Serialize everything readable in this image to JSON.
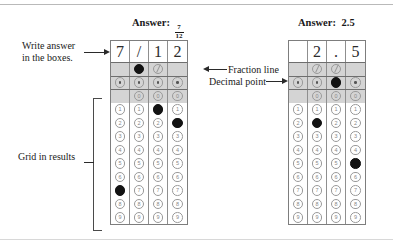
{
  "figure": {
    "title_hidden": "",
    "annotations": {
      "write_answer": "Write answer\nin the boxes.",
      "write_answer_line1": "Write answer",
      "write_answer_line2": "in the boxes.",
      "grid_in_results": "Grid in results",
      "fraction_line": "Fraction line",
      "decimal_point": "Decimal point"
    },
    "colors": {
      "fill": "#131313",
      "bubble_outline": "#9a9a9a",
      "band": "#d4d4d4",
      "grid_border": "#7d7d7d",
      "text": "#1a1a1a"
    }
  },
  "grids": [
    {
      "id": "left",
      "heading_label": "Answer:",
      "heading_value_type": "fraction",
      "heading_numerator": "7",
      "heading_denominator": "12",
      "heading_value": "7/12",
      "columns": [
        {
          "written": "7",
          "fraction_bubble": {
            "present": false,
            "filled": false,
            "glyph": "/"
          },
          "decimal_bubble": {
            "present": true,
            "filled": false,
            "glyph": "."
          },
          "digits": [
            {
              "label": "0",
              "present": false,
              "filled": false
            },
            {
              "label": "1",
              "present": true,
              "filled": false
            },
            {
              "label": "2",
              "present": true,
              "filled": false
            },
            {
              "label": "3",
              "present": true,
              "filled": false
            },
            {
              "label": "4",
              "present": true,
              "filled": false
            },
            {
              "label": "5",
              "present": true,
              "filled": false
            },
            {
              "label": "6",
              "present": true,
              "filled": false
            },
            {
              "label": "7",
              "present": true,
              "filled": true
            },
            {
              "label": "8",
              "present": true,
              "filled": false
            },
            {
              "label": "9",
              "present": true,
              "filled": false
            }
          ]
        },
        {
          "written": "/",
          "fraction_bubble": {
            "present": true,
            "filled": true,
            "glyph": "/"
          },
          "decimal_bubble": {
            "present": true,
            "filled": false,
            "glyph": "."
          },
          "digits": [
            {
              "label": "0",
              "present": true,
              "filled": false
            },
            {
              "label": "1",
              "present": true,
              "filled": false
            },
            {
              "label": "2",
              "present": true,
              "filled": false
            },
            {
              "label": "3",
              "present": true,
              "filled": false
            },
            {
              "label": "4",
              "present": true,
              "filled": false
            },
            {
              "label": "5",
              "present": true,
              "filled": false
            },
            {
              "label": "6",
              "present": true,
              "filled": false
            },
            {
              "label": "7",
              "present": true,
              "filled": false
            },
            {
              "label": "8",
              "present": true,
              "filled": false
            },
            {
              "label": "9",
              "present": true,
              "filled": false
            }
          ]
        },
        {
          "written": "1",
          "fraction_bubble": {
            "present": true,
            "filled": false,
            "glyph": "/"
          },
          "decimal_bubble": {
            "present": true,
            "filled": false,
            "glyph": "."
          },
          "digits": [
            {
              "label": "0",
              "present": true,
              "filled": false
            },
            {
              "label": "1",
              "present": true,
              "filled": true
            },
            {
              "label": "2",
              "present": true,
              "filled": false
            },
            {
              "label": "3",
              "present": true,
              "filled": false
            },
            {
              "label": "4",
              "present": true,
              "filled": false
            },
            {
              "label": "5",
              "present": true,
              "filled": false
            },
            {
              "label": "6",
              "present": true,
              "filled": false
            },
            {
              "label": "7",
              "present": true,
              "filled": false
            },
            {
              "label": "8",
              "present": true,
              "filled": false
            },
            {
              "label": "9",
              "present": true,
              "filled": false
            }
          ]
        },
        {
          "written": "2",
          "fraction_bubble": {
            "present": false,
            "filled": false,
            "glyph": "/"
          },
          "decimal_bubble": {
            "present": true,
            "filled": false,
            "glyph": "."
          },
          "digits": [
            {
              "label": "0",
              "present": true,
              "filled": false
            },
            {
              "label": "1",
              "present": true,
              "filled": false
            },
            {
              "label": "2",
              "present": true,
              "filled": true
            },
            {
              "label": "3",
              "present": true,
              "filled": false
            },
            {
              "label": "4",
              "present": true,
              "filled": false
            },
            {
              "label": "5",
              "present": true,
              "filled": false
            },
            {
              "label": "6",
              "present": true,
              "filled": false
            },
            {
              "label": "7",
              "present": true,
              "filled": false
            },
            {
              "label": "8",
              "present": true,
              "filled": false
            },
            {
              "label": "9",
              "present": true,
              "filled": false
            }
          ]
        }
      ]
    },
    {
      "id": "right",
      "heading_label": "Answer:",
      "heading_value_type": "decimal",
      "heading_value": "2.5",
      "columns": [
        {
          "written": "",
          "fraction_bubble": {
            "present": false,
            "filled": false,
            "glyph": "/"
          },
          "decimal_bubble": {
            "present": true,
            "filled": false,
            "glyph": "."
          },
          "digits": [
            {
              "label": "0",
              "present": false,
              "filled": false
            },
            {
              "label": "1",
              "present": true,
              "filled": false
            },
            {
              "label": "2",
              "present": true,
              "filled": false
            },
            {
              "label": "3",
              "present": true,
              "filled": false
            },
            {
              "label": "4",
              "present": true,
              "filled": false
            },
            {
              "label": "5",
              "present": true,
              "filled": false
            },
            {
              "label": "6",
              "present": true,
              "filled": false
            },
            {
              "label": "7",
              "present": true,
              "filled": false
            },
            {
              "label": "8",
              "present": true,
              "filled": false
            },
            {
              "label": "9",
              "present": true,
              "filled": false
            }
          ]
        },
        {
          "written": "2",
          "fraction_bubble": {
            "present": true,
            "filled": false,
            "glyph": "/"
          },
          "decimal_bubble": {
            "present": true,
            "filled": false,
            "glyph": "."
          },
          "digits": [
            {
              "label": "0",
              "present": true,
              "filled": false
            },
            {
              "label": "1",
              "present": true,
              "filled": false
            },
            {
              "label": "2",
              "present": true,
              "filled": true
            },
            {
              "label": "3",
              "present": true,
              "filled": false
            },
            {
              "label": "4",
              "present": true,
              "filled": false
            },
            {
              "label": "5",
              "present": true,
              "filled": false
            },
            {
              "label": "6",
              "present": true,
              "filled": false
            },
            {
              "label": "7",
              "present": true,
              "filled": false
            },
            {
              "label": "8",
              "present": true,
              "filled": false
            },
            {
              "label": "9",
              "present": true,
              "filled": false
            }
          ]
        },
        {
          "written": ".",
          "fraction_bubble": {
            "present": true,
            "filled": false,
            "glyph": "/"
          },
          "decimal_bubble": {
            "present": true,
            "filled": true,
            "glyph": "."
          },
          "digits": [
            {
              "label": "0",
              "present": true,
              "filled": false
            },
            {
              "label": "1",
              "present": true,
              "filled": false
            },
            {
              "label": "2",
              "present": true,
              "filled": false
            },
            {
              "label": "3",
              "present": true,
              "filled": false
            },
            {
              "label": "4",
              "present": true,
              "filled": false
            },
            {
              "label": "5",
              "present": true,
              "filled": false
            },
            {
              "label": "6",
              "present": true,
              "filled": false
            },
            {
              "label": "7",
              "present": true,
              "filled": false
            },
            {
              "label": "8",
              "present": true,
              "filled": false
            },
            {
              "label": "9",
              "present": true,
              "filled": false
            }
          ]
        },
        {
          "written": "5",
          "fraction_bubble": {
            "present": false,
            "filled": false,
            "glyph": "/"
          },
          "decimal_bubble": {
            "present": true,
            "filled": false,
            "glyph": "."
          },
          "digits": [
            {
              "label": "0",
              "present": true,
              "filled": false
            },
            {
              "label": "1",
              "present": true,
              "filled": false
            },
            {
              "label": "2",
              "present": true,
              "filled": false
            },
            {
              "label": "3",
              "present": true,
              "filled": false
            },
            {
              "label": "4",
              "present": true,
              "filled": false
            },
            {
              "label": "5",
              "present": true,
              "filled": true
            },
            {
              "label": "6",
              "present": true,
              "filled": false
            },
            {
              "label": "7",
              "present": true,
              "filled": false
            },
            {
              "label": "8",
              "present": true,
              "filled": false
            },
            {
              "label": "9",
              "present": true,
              "filled": false
            }
          ]
        }
      ]
    }
  ]
}
